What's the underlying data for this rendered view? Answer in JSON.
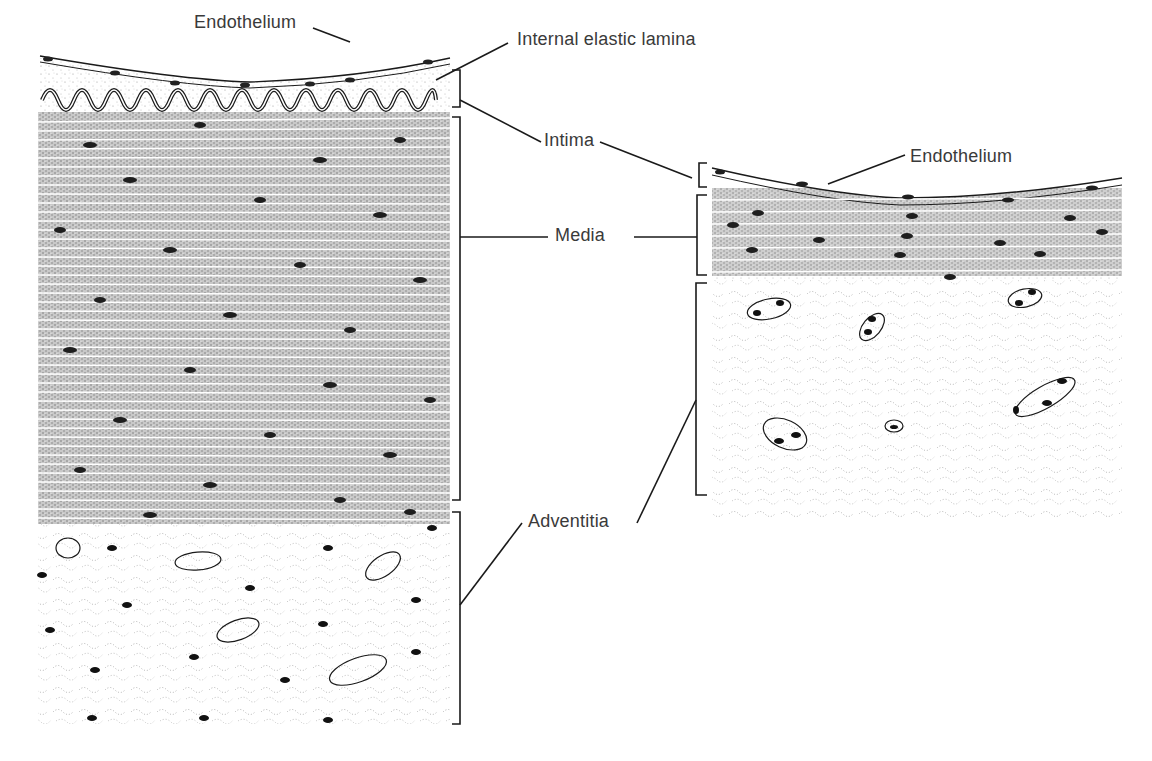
{
  "diagram": {
    "type": "histology-comparison",
    "panels": [
      {
        "id": "left-vessel",
        "layers": [
          "Endothelium",
          "Internal elastic lamina",
          "Intima",
          "Media",
          "Adventitia"
        ]
      },
      {
        "id": "right-vessel",
        "layers": [
          "Endothelium",
          "Intima",
          "Media",
          "Adventitia"
        ]
      }
    ]
  },
  "labels": {
    "endothelium_left": "Endothelium",
    "internal_elastic_lamina": "Internal elastic lamina",
    "intima": "Intima",
    "media": "Media",
    "adventitia": "Adventitia",
    "endothelium_right": "Endothelium"
  },
  "colors": {
    "ink": "#1a1a1a",
    "label": "#3a3a3a",
    "stipple": "#8a8a8a",
    "muscle_fill": "#bdbdbd",
    "background": "#ffffff"
  }
}
